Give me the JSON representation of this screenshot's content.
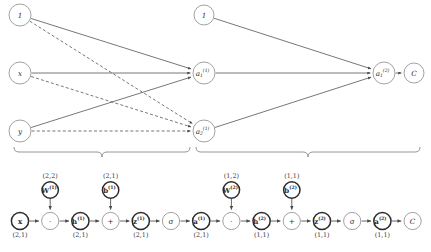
{
  "figure": {
    "colors": {
      "background": "#ffffff",
      "edge": "#4a4a4a",
      "node_bold_stroke": "#2b2b2b",
      "node_thin_stroke": "#8a8a8a",
      "brace": "#8a8a8a",
      "text": "#2b2b2b"
    }
  },
  "network": {
    "nodes": {
      "bias_in": {
        "label": "1"
      },
      "input_x": {
        "label": "x"
      },
      "input_y": {
        "label": "y"
      },
      "bias_hidden": {
        "label": "1"
      },
      "hidden_1": {
        "base": "a",
        "sub": "1",
        "sup": "(1)"
      },
      "hidden_2": {
        "base": "a",
        "sub": "2",
        "sup": "(1)"
      },
      "output_1": {
        "base": "a",
        "sub": "1",
        "sup": "(2)"
      },
      "cost": {
        "label": "C"
      }
    },
    "edges": [
      {
        "from": "bias_in",
        "to": "hidden_1",
        "style": "solid"
      },
      {
        "from": "input_x",
        "to": "hidden_1",
        "style": "solid"
      },
      {
        "from": "input_y",
        "to": "hidden_1",
        "style": "solid"
      },
      {
        "from": "bias_in",
        "to": "hidden_2",
        "style": "dashed"
      },
      {
        "from": "input_x",
        "to": "hidden_2",
        "style": "dashed"
      },
      {
        "from": "input_y",
        "to": "hidden_2",
        "style": "dashed"
      },
      {
        "from": "bias_hidden",
        "to": "output_1",
        "style": "solid"
      },
      {
        "from": "hidden_1",
        "to": "output_1",
        "style": "solid"
      },
      {
        "from": "hidden_2",
        "to": "output_1",
        "style": "solid"
      },
      {
        "from": "output_1",
        "to": "cost",
        "style": "solid"
      }
    ]
  },
  "braces": [
    {
      "name": "layer-1-brace",
      "x_start": 14,
      "x_end": 190
    },
    {
      "name": "layer-2-brace",
      "x_start": 196,
      "x_end": 420
    }
  ],
  "graph": {
    "params": [
      {
        "id": "W1",
        "base": "W",
        "sup": "(1)",
        "dim": "(2,2)"
      },
      {
        "id": "b1",
        "base": "b",
        "sup": "(1)",
        "dim": "(2,1)"
      },
      {
        "id": "W2",
        "base": "W",
        "sup": "(2)",
        "dim": "(1,2)"
      },
      {
        "id": "b2",
        "base": "b",
        "sup": "(2)",
        "dim": "(1,1)"
      }
    ],
    "chain": [
      {
        "id": "x",
        "base": "x",
        "sup": "",
        "dim": "(2,1)",
        "kind": "bold",
        "glyph": ""
      },
      {
        "id": "m1",
        "base": "",
        "sup": "",
        "dim": "",
        "kind": "thin",
        "glyph": "·"
      },
      {
        "id": "h1",
        "base": "h",
        "sup": "(1)",
        "dim": "(2,1)",
        "kind": "bold",
        "glyph": ""
      },
      {
        "id": "p1",
        "base": "",
        "sup": "",
        "dim": "",
        "kind": "thin",
        "glyph": "+"
      },
      {
        "id": "z1",
        "base": "z",
        "sup": "(1)",
        "dim": "(2,1)",
        "kind": "bold",
        "glyph": ""
      },
      {
        "id": "s1",
        "base": "",
        "sup": "",
        "dim": "",
        "kind": "thin",
        "glyph": "σ"
      },
      {
        "id": "a1",
        "base": "a",
        "sup": "(1)",
        "dim": "(2,1)",
        "kind": "bold",
        "glyph": ""
      },
      {
        "id": "m2",
        "base": "",
        "sup": "",
        "dim": "",
        "kind": "thin",
        "glyph": "·"
      },
      {
        "id": "h2",
        "base": "h",
        "sup": "(2)",
        "dim": "(1,1)",
        "kind": "bold",
        "glyph": ""
      },
      {
        "id": "p2",
        "base": "",
        "sup": "",
        "dim": "",
        "kind": "thin",
        "glyph": "+"
      },
      {
        "id": "z2",
        "base": "z",
        "sup": "(2)",
        "dim": "(1,1)",
        "kind": "bold",
        "glyph": ""
      },
      {
        "id": "s2",
        "base": "",
        "sup": "",
        "dim": "",
        "kind": "thin",
        "glyph": "σ"
      },
      {
        "id": "a2",
        "base": "a",
        "sup": "(2)",
        "dim": "(1,1)",
        "kind": "bold",
        "glyph": ""
      },
      {
        "id": "C",
        "base": "C",
        "sup": "",
        "dim": "",
        "kind": "thin",
        "glyph": ""
      }
    ]
  }
}
